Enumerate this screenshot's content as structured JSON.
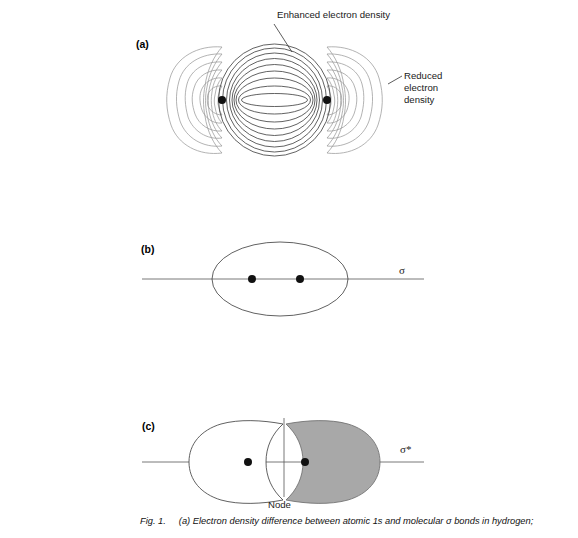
{
  "figure": {
    "panels": [
      {
        "id": "a",
        "label": "(a)",
        "label_x": 136,
        "label_y": 48,
        "type": "electron-density-difference-contour-map",
        "nuclei": [
          {
            "x": 222,
            "y": 100
          },
          {
            "x": 327,
            "y": 100
          }
        ],
        "annotations": [
          {
            "name": "enhanced-electron-density",
            "text": "Enhanced electron density",
            "lines": [
              "Enhanced electron density"
            ],
            "text_x": 277,
            "text_y": 18,
            "leader": {
              "x1": 274,
              "y1": 24,
              "x2": 292,
              "y2": 52
            }
          },
          {
            "name": "reduced-electron-density",
            "text": "Reduced electron density",
            "lines": [
              "Reduced",
              "electron",
              "density"
            ],
            "text_x": 404,
            "text_y": 77,
            "leader": {
              "x1": 402,
              "y1": 76,
              "x2": 388,
              "y2": 84
            }
          }
        ],
        "contour_counts": {
          "center_enhanced": 9,
          "outer_reduced": 6
        }
      },
      {
        "id": "b",
        "label": "(b)",
        "label_x": 141,
        "label_y": 253,
        "type": "sigma-bonding-molecular-orbital",
        "axis_label": "σ",
        "axis_label_x": 399,
        "axis_label_y": 274,
        "axis": {
          "x1": 142,
          "y1": 279,
          "x2": 424,
          "y2": 279
        },
        "nuclei": [
          {
            "x": 252,
            "y": 279
          },
          {
            "x": 300,
            "y": 279
          }
        ],
        "orbital": {
          "cx": 280,
          "cy": 279,
          "rx": 68,
          "ry": 37
        }
      },
      {
        "id": "c",
        "label": "(c)",
        "label_x": 142,
        "label_y": 430,
        "type": "sigma-star-antibonding-molecular-orbital",
        "axis_label": "σ*",
        "axis_label_x": 400,
        "axis_label_y": 453,
        "axis": {
          "x1": 142,
          "y1": 462,
          "x2": 424,
          "y2": 462
        },
        "node_label": "Node",
        "node_label_x": 268,
        "node_label_y": 504,
        "node_line": {
          "x": 284,
          "y1": 418,
          "y2": 497
        },
        "nuclei": [
          {
            "x": 248,
            "y": 462
          },
          {
            "x": 305,
            "y": 462
          }
        ],
        "left_lobe_fill": "#ffffff",
        "right_lobe_fill": "#a8a8a8"
      }
    ],
    "caption": {
      "fig_number": "Fig. 1.",
      "text": "(a) Electron density difference between atomic 1s and molecular σ bonds in hydrogen;"
    }
  },
  "colors": {
    "background": "#ffffff",
    "ink": "#111111",
    "outer_contour": "#9a9a9a",
    "inner_contour": "#3a3a3a",
    "gray_fill": "#a8a8a8",
    "axis": "#555555"
  }
}
